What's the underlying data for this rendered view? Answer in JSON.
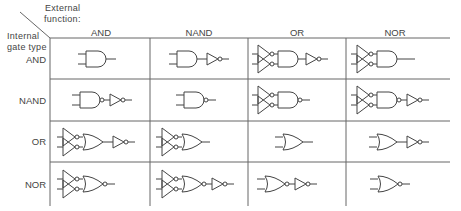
{
  "corner": {
    "external_label_line1": "External",
    "external_label_line2": "function:",
    "internal_label_line1": "Internal",
    "internal_label_line2": "gate type"
  },
  "columns": [
    "AND",
    "NAND",
    "OR",
    "NOR"
  ],
  "rows": [
    {
      "label": "AND",
      "cells": [
        "AND",
        "AND + NOT",
        "NOT inputs + AND + NOT",
        "NOT inputs + AND"
      ]
    },
    {
      "label": "NAND",
      "cells": [
        "NAND + NOT",
        "NAND",
        "NOT inputs + NAND",
        "NOT inputs + NAND + NOT"
      ]
    },
    {
      "label": "OR",
      "cells": [
        "NOT inputs + OR + NOT",
        "NOT inputs + OR",
        "OR",
        "OR + NOT"
      ]
    },
    {
      "label": "NOR",
      "cells": [
        "NOT inputs + NOR",
        "NOT inputs + NOR + NOT",
        "NOR + NOT",
        "NOR"
      ]
    }
  ],
  "colors": {
    "line": "#555555",
    "background": "#ffffff"
  }
}
